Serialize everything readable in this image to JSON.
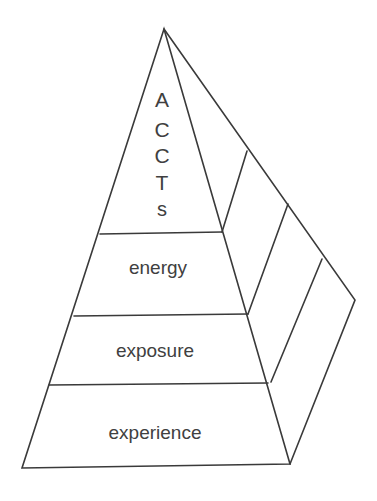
{
  "diagram": {
    "type": "pyramid",
    "top_label_letters": [
      "A",
      "C",
      "C",
      "T",
      "s"
    ],
    "levels": [
      {
        "label": "energy"
      },
      {
        "label": "exposure"
      },
      {
        "label": "experience"
      }
    ],
    "colors": {
      "line": "#3a3a3a",
      "text": "#404040",
      "background": "#ffffff"
    }
  }
}
